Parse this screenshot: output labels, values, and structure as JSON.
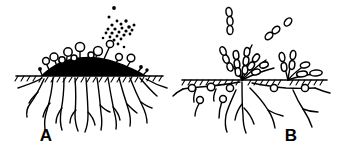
{
  "figure": {
    "type": "scientific-line-illustration",
    "medium": "black ink on white",
    "colors": {
      "ink": "#000000",
      "background": "#ffffff",
      "fill": "#ffffff"
    },
    "width": 337,
    "height": 154
  },
  "panels": [
    {
      "id": "A",
      "label": "A",
      "label_x": 46,
      "label_y": 140,
      "soil_line_y": 76,
      "soil_line_x1": 16,
      "soil_line_x2": 160,
      "colony": {
        "name": "dark-mound-colony",
        "fill": "#000000",
        "base_left_x": 41,
        "base_right_x": 146,
        "apex_x": 93,
        "apex_y": 58
      },
      "sporangiophores": [
        {
          "base_x": 42,
          "base_y": 74,
          "tip_x": 40,
          "tip_y": 69,
          "radius": 1.8
        },
        {
          "base_x": 50,
          "base_y": 71,
          "tip_x": 47,
          "tip_y": 61,
          "radius": 3.4
        },
        {
          "base_x": 57,
          "base_y": 69,
          "tip_x": 55,
          "tip_y": 57,
          "radius": 4.0
        },
        {
          "base_x": 62,
          "base_y": 68,
          "tip_x": 62,
          "tip_y": 60,
          "radius": 3.2
        },
        {
          "base_x": 64,
          "base_y": 67,
          "tip_x": 67,
          "tip_y": 52,
          "radius": 4.2
        },
        {
          "base_x": 72,
          "base_y": 65,
          "tip_x": 73,
          "tip_y": 58,
          "radius": 3.0
        },
        {
          "base_x": 80,
          "base_y": 62,
          "tip_x": 80,
          "tip_y": 47,
          "radius": 4.6
        },
        {
          "base_x": 92,
          "base_y": 58,
          "tip_x": 92,
          "tip_y": 55,
          "radius": 3.0
        },
        {
          "base_x": 95,
          "base_y": 58,
          "tip_x": 97,
          "tip_y": 51,
          "radius": 4.4
        },
        {
          "base_x": 104,
          "base_y": 60,
          "tip_x": 110,
          "tip_y": 44,
          "radius": 3.6
        },
        {
          "base_x": 116,
          "base_y": 64,
          "tip_x": 119,
          "tip_y": 57,
          "radius": 3.4
        },
        {
          "base_x": 127,
          "base_y": 67,
          "tip_x": 131,
          "tip_y": 58,
          "radius": 3.8
        },
        {
          "base_x": 138,
          "base_y": 71,
          "tip_x": 141,
          "tip_y": 67,
          "radius": 1.8
        },
        {
          "base_x": 144,
          "base_y": 73,
          "tip_x": 147,
          "tip_y": 70,
          "radius": 1.6
        }
      ],
      "spore_cloud": {
        "name": "released-spore-cloud",
        "direction": "upward-right",
        "dots": [
          {
            "x": 114,
            "y": 8,
            "r": 1.9
          },
          {
            "x": 109,
            "y": 17,
            "r": 1.5
          },
          {
            "x": 117,
            "y": 21,
            "r": 1.4
          },
          {
            "x": 112,
            "y": 25,
            "r": 1.6
          },
          {
            "x": 121,
            "y": 24,
            "r": 1.5
          },
          {
            "x": 126,
            "y": 21,
            "r": 1.7
          },
          {
            "x": 108,
            "y": 29,
            "r": 1.5
          },
          {
            "x": 115,
            "y": 29,
            "r": 1.6
          },
          {
            "x": 122,
            "y": 28,
            "r": 1.5
          },
          {
            "x": 129,
            "y": 27,
            "r": 1.8
          },
          {
            "x": 134,
            "y": 25,
            "r": 1.5
          },
          {
            "x": 106,
            "y": 33,
            "r": 1.4
          },
          {
            "x": 112,
            "y": 33,
            "r": 1.6
          },
          {
            "x": 119,
            "y": 32,
            "r": 1.5
          },
          {
            "x": 126,
            "y": 31,
            "r": 1.6
          },
          {
            "x": 132,
            "y": 30,
            "r": 1.5
          },
          {
            "x": 110,
            "y": 37,
            "r": 1.4
          },
          {
            "x": 117,
            "y": 36,
            "r": 1.5
          },
          {
            "x": 124,
            "y": 35,
            "r": 1.6
          },
          {
            "x": 130,
            "y": 34,
            "r": 1.4
          },
          {
            "x": 114,
            "y": 40,
            "r": 1.5
          },
          {
            "x": 121,
            "y": 39,
            "r": 1.4
          },
          {
            "x": 103,
            "y": 38,
            "r": 1.3
          },
          {
            "x": 118,
            "y": 44,
            "r": 1.4
          },
          {
            "x": 124,
            "y": 47,
            "r": 1.3
          }
        ]
      },
      "roots": {
        "name": "subsurface-hyphae",
        "count": 12,
        "max_depth_y": 130
      }
    },
    {
      "id": "B",
      "label": "B",
      "label_x": 291,
      "label_y": 140,
      "soil_line_y": 80,
      "soil_line_x1": 182,
      "soil_line_x2": 325,
      "conidiophore_clusters": [
        {
          "name": "central-cluster",
          "origin_x": 242,
          "origin_y": 80
        },
        {
          "name": "right-cluster",
          "origin_x": 288,
          "origin_y": 80
        }
      ],
      "conidia_chains": [
        {
          "name": "detached-chain-vertical",
          "x": 229,
          "y": 16,
          "count": 3,
          "angle": 78
        },
        {
          "name": "detached-chain-diagonal",
          "x": 272,
          "y": 32,
          "count": 2,
          "angle": 40
        },
        {
          "name": "detached-conidium-single",
          "x": 285,
          "y": 22,
          "count": 1,
          "angle": 30
        }
      ],
      "subsurface_vesicles": [
        {
          "x": 192,
          "y": 88,
          "r": 3.6
        },
        {
          "x": 211,
          "y": 87,
          "r": 3.8
        },
        {
          "x": 230,
          "y": 88,
          "r": 3.6
        },
        {
          "x": 274,
          "y": 88,
          "r": 3.6
        },
        {
          "x": 305,
          "y": 88,
          "r": 3.6
        },
        {
          "x": 200,
          "y": 99,
          "r": 3.4
        },
        {
          "x": 223,
          "y": 98,
          "r": 3.4
        }
      ],
      "roots": {
        "name": "subsurface-hyphae",
        "count": 9,
        "max_depth_y": 132
      }
    }
  ],
  "caption": {
    "visible": false,
    "text": ""
  }
}
